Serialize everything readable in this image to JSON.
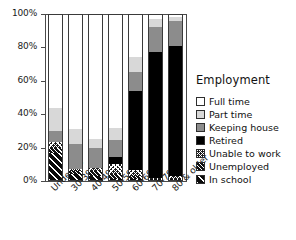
{
  "chart_data": {
    "type": "bar",
    "subtype": "stacked-percent",
    "title": "",
    "xlabel": "",
    "ylabel": "",
    "ylim": [
      0,
      100
    ],
    "ytick_labels": [
      "0%",
      "20%",
      "40%",
      "60%",
      "80%",
      "100%"
    ],
    "ytick_values": [
      0,
      20,
      40,
      60,
      80,
      100
    ],
    "grid": false,
    "legend_position": "right",
    "legend_title": "Employment",
    "categories": [
      "Under 30",
      "30-39",
      "40-49",
      "50-59",
      "60-69",
      "70-79",
      "80 & older"
    ],
    "series": [
      {
        "name": "In school",
        "swatch": "diagonal-wide-hatch",
        "values": [
          17.0,
          4.0,
          3.0,
          1.0,
          1.0,
          0.5,
          0.5
        ]
      },
      {
        "name": "Unemployed",
        "swatch": "diagonal-dense-hatch",
        "values": [
          3.0,
          2.0,
          3.0,
          3.0,
          2.0,
          0.5,
          0.5
        ]
      },
      {
        "name": "Unable to work",
        "swatch": "crosshatch",
        "values": [
          3.5,
          1.0,
          2.0,
          6.0,
          3.5,
          1.0,
          2.0
        ]
      },
      {
        "name": "Retired",
        "swatch": "solid-black",
        "values": [
          0.0,
          0.0,
          0.0,
          4.5,
          47.5,
          75.0,
          78.0
        ]
      },
      {
        "name": "Keeping house",
        "swatch": "mid-gray",
        "values": [
          6.5,
          15.0,
          11.5,
          10.0,
          11.0,
          15.5,
          15.0
        ]
      },
      {
        "name": "Part time",
        "swatch": "light-gray",
        "values": [
          14.0,
          9.0,
          5.5,
          7.5,
          9.0,
          4.5,
          2.5
        ]
      },
      {
        "name": "Full time",
        "swatch": "white",
        "values": [
          56.0,
          69.0,
          75.0,
          68.0,
          26.0,
          3.0,
          1.5
        ]
      }
    ]
  },
  "legend": {
    "title": "Employment",
    "items": [
      {
        "label": "Full time",
        "swatch": "white"
      },
      {
        "label": "Part time",
        "swatch": "light-gray"
      },
      {
        "label": "Keeping house",
        "swatch": "mid-gray"
      },
      {
        "label": "Retired",
        "swatch": "solid-black"
      },
      {
        "label": "Unable to work",
        "swatch": "crosshatch"
      },
      {
        "label": "Unemployed",
        "swatch": "diagonal-dense-hatch"
      },
      {
        "label": "In school",
        "swatch": "diagonal-wide-hatch"
      }
    ]
  },
  "colors": {
    "full_time": "#ffffff",
    "part_time": "#d8d8d8",
    "keeping_house": "#8c8c8c",
    "retired": "#000000",
    "axis": "#4a4a4a",
    "text": "#111111"
  }
}
